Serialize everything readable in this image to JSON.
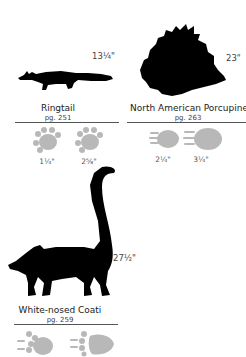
{
  "animals": [
    {
      "name": "Ringtail",
      "page": "pg. 251",
      "length": "13¼\"",
      "tracks": [
        {
          "label": "1¼\"",
          "type": "front"
        },
        {
          "label": "2⅝\"",
          "type": "hind"
        }
      ]
    },
    {
      "name": "North American Porcupine",
      "page": "pg. 263",
      "height": "23\"",
      "tracks": [
        {
          "label": "2¼\"",
          "type": "front"
        },
        {
          "label": "3¼\"",
          "type": "hind"
        }
      ]
    },
    {
      "name": "White-nosed Coati",
      "page": "pg. 259",
      "height": "27½\"",
      "tracks": [
        {
          "label": "",
          "type": "front"
        },
        {
          "label": "",
          "type": "hind"
        }
      ]
    }
  ],
  "colors": {
    "silhouette": "#000000",
    "track": "#b8b8b8",
    "rule": "#555555"
  }
}
